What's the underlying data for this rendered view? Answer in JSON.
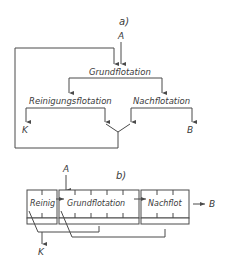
{
  "diagram_a": {
    "label": "a)",
    "input": "A",
    "nodes": {
      "grund": "Grundflotation",
      "reinigung": "Reinigungsflotation",
      "nach": "Nachflotation"
    },
    "outputs": {
      "concentrate": "K",
      "tailings": "B"
    },
    "edges": [
      {
        "from": "A",
        "to": "Grundflotation"
      },
      {
        "from": "Grundflotation",
        "to": "Reinigungsflotation"
      },
      {
        "from": "Grundflotation",
        "to": "Nachflotation"
      },
      {
        "from": "Reinigungsflotation",
        "to": "K"
      },
      {
        "from": "Nachflotation",
        "to": "B"
      },
      {
        "from": "Reinigungsflotation",
        "to": "Grundflotation",
        "note": "recycle via merge"
      },
      {
        "from": "Nachflotation",
        "to": "Grundflotation",
        "note": "recycle via merge"
      }
    ]
  },
  "diagram_b": {
    "label": "b)",
    "input": "A",
    "cells": {
      "reinig": "Reinig",
      "grund": "Grundflotation",
      "nach": "Nachflot"
    },
    "outputs": {
      "concentrate": "K",
      "tailings": "B"
    }
  },
  "colors": {
    "line": "#4a4a4a",
    "text": "#3a3a3a",
    "background": "#ffffff"
  }
}
